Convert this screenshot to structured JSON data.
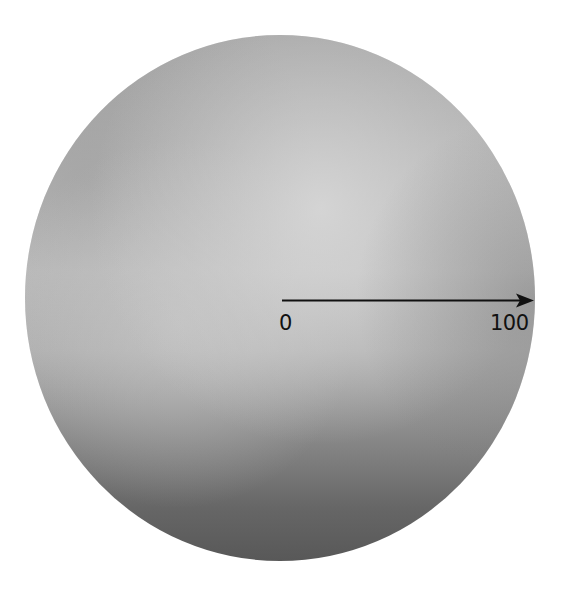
{
  "diagram": {
    "disc": {
      "center": [
        280,
        298
      ],
      "radius_x": 255,
      "radius_y": 263,
      "colors": {
        "top": "#a9a9a9",
        "upper_left": "#9c9c9c",
        "center_light": "#cdcdcd",
        "right_edge": "#8a8a8a",
        "bottom": "#555555"
      }
    },
    "arrow": {
      "start": [
        282,
        300
      ],
      "end": [
        533,
        300
      ],
      "color": "#111111"
    },
    "scale": {
      "start_label": "0",
      "end_label": "100"
    }
  }
}
